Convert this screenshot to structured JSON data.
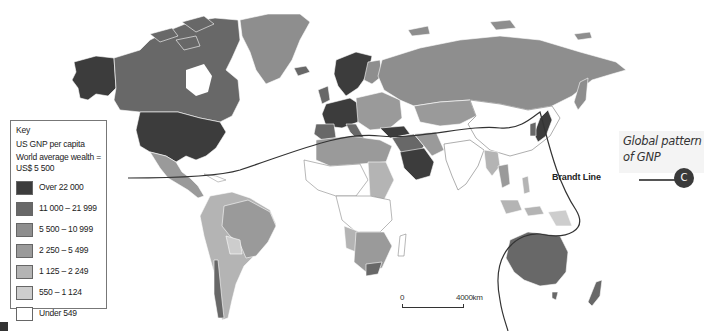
{
  "map": {
    "title": "Global pattern of GNP",
    "title_lines": [
      "Global pattern",
      "of GNP"
    ],
    "badge": "C",
    "brandt_line_label": "Brandt Line",
    "scale": {
      "start": "0",
      "end": "4000km"
    }
  },
  "key": {
    "title": "Key",
    "subtitle": "US GNP per capita",
    "world_average_line1": "World average wealth =",
    "world_average_line2": "US$ 5 500",
    "items": [
      {
        "label": "Over 22 000",
        "color": "#3c3c3c"
      },
      {
        "label": "11 000 – 21 999",
        "color": "#686868"
      },
      {
        "label": "5 500 – 10 999",
        "color": "#8e8e8e"
      },
      {
        "label": "2 250 – 5 499",
        "color": "#9a9a9a"
      },
      {
        "label": "1 125 – 2 249",
        "color": "#b4b4b4"
      },
      {
        "label": "550 – 1 124",
        "color": "#cdcdcd"
      },
      {
        "label": "Under 549",
        "color": "#ffffff"
      }
    ]
  },
  "regions": [
    {
      "name": "USA",
      "class": "Over 22 000"
    },
    {
      "name": "Canada",
      "class": "11 000 – 21 999"
    },
    {
      "name": "Alaska",
      "class": "Over 22 000"
    },
    {
      "name": "Greenland",
      "class": "5 500 – 10 999"
    },
    {
      "name": "Western Europe",
      "class": "Over 22 000"
    },
    {
      "name": "Scandinavia",
      "class": "Over 22 000"
    },
    {
      "name": "Russia",
      "class": "5 500 – 10 999"
    },
    {
      "name": "Saudi Arabia",
      "class": "Over 22 000"
    },
    {
      "name": "Australia",
      "class": "11 000 – 21 999"
    },
    {
      "name": "New Zealand",
      "class": "11 000 – 21 999"
    },
    {
      "name": "Japan",
      "class": "Over 22 000"
    },
    {
      "name": "Brazil",
      "class": "2 250 – 5 499"
    },
    {
      "name": "Mexico",
      "class": "2 250 – 5 499"
    },
    {
      "name": "Argentina",
      "class": "1 125 – 2 249"
    },
    {
      "name": "China",
      "class": "Under 549"
    },
    {
      "name": "India",
      "class": "Under 549"
    },
    {
      "name": "Central Africa",
      "class": "Under 549"
    },
    {
      "name": "Southern Africa",
      "class": "2 250 – 5 499"
    }
  ]
}
